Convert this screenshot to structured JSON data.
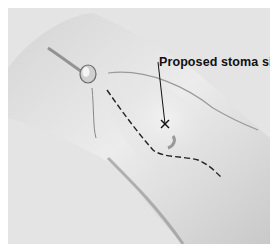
{
  "figure": {
    "annotation": {
      "label": "Proposed stoma site",
      "marker": "x-mark"
    },
    "colors": {
      "background": "#e4e4e4",
      "border": "#ffffff",
      "ink": "#111111"
    }
  }
}
